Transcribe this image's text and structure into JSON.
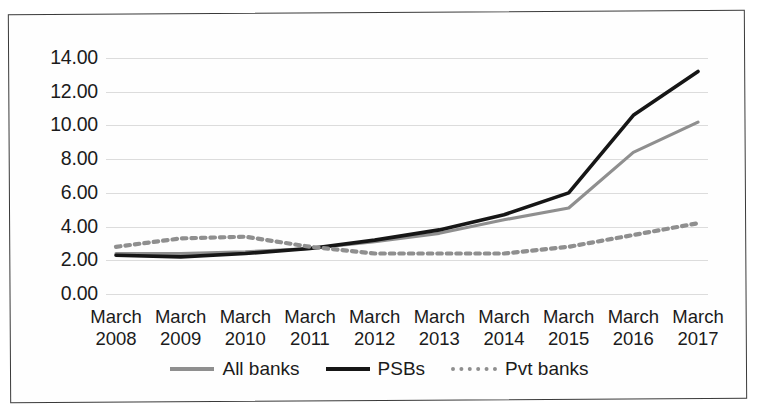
{
  "chart_data": {
    "type": "line",
    "title": "",
    "xlabel": "",
    "ylabel": "",
    "ylim": [
      0,
      14
    ],
    "ytick_labels": [
      "14.00",
      "12.00",
      "10.00",
      "8.00",
      "6.00",
      "4.00",
      "2.00",
      "0.00"
    ],
    "ytick_values": [
      14,
      12,
      10,
      8,
      6,
      4,
      2,
      0
    ],
    "grid": true,
    "legend_position": "bottom-center",
    "categories": [
      "March 2008",
      "March 2009",
      "March 2010",
      "March 2011",
      "March 2012",
      "March 2013",
      "March 2014",
      "March 2015",
      "March 2016",
      "March 2017"
    ],
    "category_lines": [
      [
        "March",
        "2008"
      ],
      [
        "March",
        "2009"
      ],
      [
        "March",
        "2010"
      ],
      [
        "March",
        "2011"
      ],
      [
        "March",
        "2012"
      ],
      [
        "March",
        "2013"
      ],
      [
        "March",
        "2014"
      ],
      [
        "March",
        "2015"
      ],
      [
        "March",
        "2016"
      ],
      [
        "March",
        "2017"
      ]
    ],
    "series": [
      {
        "name": "All banks",
        "color": "#8f8f8f",
        "style": "solid",
        "values": [
          2.4,
          2.4,
          2.5,
          2.7,
          3.1,
          3.6,
          4.4,
          5.1,
          8.4,
          10.2
        ]
      },
      {
        "name": "PSBs",
        "color": "#161616",
        "style": "solid",
        "values": [
          2.3,
          2.2,
          2.4,
          2.7,
          3.2,
          3.8,
          4.7,
          6.0,
          10.6,
          13.2
        ]
      },
      {
        "name": "Pvt banks",
        "color": "#8f8f8f",
        "style": "dotted",
        "values": [
          2.8,
          3.3,
          3.4,
          2.8,
          2.4,
          2.4,
          2.4,
          2.8,
          3.5,
          4.2
        ]
      }
    ]
  },
  "legend": {
    "items": [
      {
        "label": "All banks"
      },
      {
        "label": "PSBs"
      },
      {
        "label": "Pvt banks"
      }
    ]
  }
}
